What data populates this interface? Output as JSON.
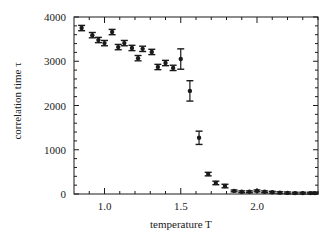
{
  "chart_data": {
    "type": "scatter",
    "title": "",
    "xlabel": "temperature T",
    "ylabel": "correlation time τ",
    "xlim": [
      0.8,
      2.4
    ],
    "ylim": [
      0,
      4000
    ],
    "xticks": [
      1.0,
      1.5,
      2.0
    ],
    "xtick_labels": [
      "1.0",
      "1.5",
      "2.0"
    ],
    "yticks": [
      0,
      1000,
      2000,
      3000,
      4000
    ],
    "ytick_labels": [
      "0",
      "1000",
      "2000",
      "3000",
      "4000"
    ],
    "grid": false,
    "legend": null,
    "error_bars": true,
    "series": [
      {
        "name": "correlation time",
        "x": [
          0.85,
          0.92,
          0.96,
          1.0,
          1.05,
          1.09,
          1.13,
          1.18,
          1.22,
          1.25,
          1.31,
          1.35,
          1.4,
          1.45,
          1.5,
          1.56,
          1.62,
          1.68,
          1.73,
          1.79,
          1.85,
          1.9,
          1.95,
          2.0,
          2.05,
          2.1,
          2.15,
          2.2,
          2.25,
          2.3,
          2.35,
          2.38
        ],
        "y": [
          3750,
          3590,
          3480,
          3410,
          3660,
          3320,
          3410,
          3300,
          3070,
          3280,
          3210,
          2870,
          2960,
          2850,
          3050,
          2330,
          1270,
          450,
          250,
          180,
          70,
          50,
          50,
          70,
          50,
          40,
          30,
          25,
          20,
          20,
          20,
          20
        ],
        "err": [
          60,
          60,
          60,
          60,
          60,
          60,
          60,
          60,
          60,
          60,
          60,
          60,
          60,
          60,
          230,
          230,
          150,
          40,
          40,
          40,
          20,
          20,
          20,
          20,
          20,
          20,
          20,
          20,
          20,
          20,
          20,
          20
        ]
      }
    ]
  }
}
